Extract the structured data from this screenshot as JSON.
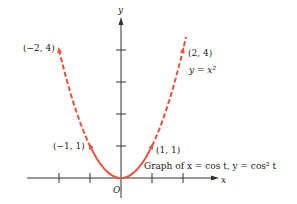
{
  "chart_data": {
    "type": "line",
    "title": "Graph of x = cos t, y = cos² t",
    "xlabel": "x",
    "ylabel": "y",
    "origin_label": "O",
    "curve_label": "y = x²",
    "xlim": [
      -2.5,
      3.5
    ],
    "ylim": [
      -0.4,
      5
    ],
    "x_ticks": [
      -2,
      -1,
      1,
      2
    ],
    "y_ticks": [
      1,
      2,
      3,
      4
    ],
    "series": [
      {
        "name": "y = x^2 (dashed, |x| > 1)",
        "style": "dashed",
        "x_range": [
          -2,
          -1
        ]
      },
      {
        "name": "x = cos t, y = cos^2 t (solid)",
        "style": "solid",
        "x_range": [
          -1,
          1
        ]
      },
      {
        "name": "y = x^2 (dashed, |x| > 1)",
        "style": "dashed",
        "x_range": [
          1,
          2.1
        ]
      }
    ],
    "points": [
      {
        "x": -2,
        "y": 4,
        "label": "(−2, 4)"
      },
      {
        "x": 2,
        "y": 4,
        "label": "(2, 4)"
      },
      {
        "x": -1,
        "y": 1,
        "label": "(−1, 1)"
      },
      {
        "x": 1,
        "y": 1,
        "label": "(1, 1)"
      }
    ],
    "colors": {
      "curve": "#e8533f",
      "axis": "#333333"
    }
  }
}
